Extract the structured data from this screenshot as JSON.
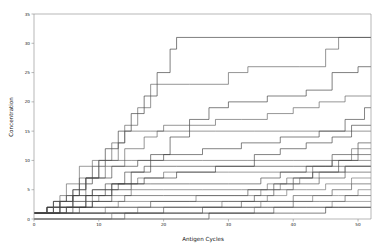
{
  "chart_data": {
    "type": "line",
    "title": "",
    "xlabel": "Antigen Cycles",
    "ylabel": "Concentration",
    "xlim": [
      0,
      52
    ],
    "ylim": [
      0,
      35
    ],
    "xticks": [
      0,
      10,
      20,
      30,
      40,
      50
    ],
    "xticklabels": [
      "0",
      "10",
      "20",
      "30",
      "40",
      "50"
    ],
    "yticks": [
      0,
      5,
      10,
      15,
      20,
      25,
      30,
      35
    ],
    "yticklabels": [
      "0",
      "5",
      "10",
      "15",
      "20",
      "25",
      "30",
      "35"
    ],
    "grid": false,
    "legend": null,
    "legend_position": "none",
    "drawstyle": "steps-post",
    "line_color": "#4d4d4d",
    "line_width": 0.6,
    "series": [
      {
        "name": "trace-1",
        "x": [
          0,
          1,
          2,
          3,
          5,
          7,
          9,
          11,
          13,
          15,
          17,
          19,
          21,
          22,
          52
        ],
        "values": [
          1,
          1,
          2,
          3,
          4,
          6,
          9,
          12,
          15,
          18,
          21,
          25,
          29,
          31,
          31
        ]
      },
      {
        "name": "trace-2",
        "x": [
          0,
          2,
          4,
          6,
          8,
          10,
          12,
          14,
          16,
          18,
          24,
          30,
          33,
          41,
          45,
          47,
          52
        ],
        "values": [
          1,
          1,
          2,
          4,
          7,
          10,
          13,
          16,
          19,
          23,
          23,
          25,
          26,
          26,
          29,
          31,
          31
        ]
      },
      {
        "name": "trace-3",
        "x": [
          0,
          3,
          6,
          9,
          12,
          15,
          18,
          21,
          24,
          27,
          30,
          36,
          42,
          46,
          50,
          52
        ],
        "values": [
          1,
          1,
          2,
          3,
          5,
          8,
          11,
          14,
          17,
          19,
          20,
          21,
          22,
          25,
          26,
          26
        ]
      },
      {
        "name": "trace-4",
        "x": [
          0,
          2,
          4,
          7,
          10,
          13,
          14,
          18,
          20,
          24,
          28,
          32,
          36,
          40,
          44,
          48,
          50,
          52
        ],
        "values": [
          1,
          2,
          4,
          7,
          10,
          13,
          15,
          15,
          16,
          16,
          17,
          17,
          18,
          19,
          20,
          21,
          21,
          21
        ]
      },
      {
        "name": "trace-5",
        "x": [
          0,
          2,
          4,
          6,
          8,
          12,
          16,
          20,
          26,
          32,
          38,
          44,
          48,
          51,
          52
        ],
        "values": [
          1,
          2,
          3,
          5,
          7,
          9,
          10,
          11,
          12,
          13,
          14,
          15,
          17,
          19,
          19
        ]
      },
      {
        "name": "trace-6",
        "x": [
          0,
          1,
          3,
          5,
          7,
          9,
          11,
          15,
          20,
          26,
          33,
          40,
          46,
          52
        ],
        "values": [
          1,
          1,
          3,
          6,
          9,
          10,
          10,
          10,
          10,
          10,
          10,
          10,
          10,
          10
        ]
      },
      {
        "name": "trace-7",
        "x": [
          0,
          2,
          5,
          8,
          11,
          14,
          17,
          22,
          28,
          34,
          40,
          45,
          49,
          52
        ],
        "values": [
          1,
          1,
          2,
          4,
          6,
          8,
          9,
          9,
          9,
          9,
          9,
          9,
          9,
          9
        ]
      },
      {
        "name": "trace-8",
        "x": [
          0,
          3,
          6,
          9,
          12,
          16,
          20,
          25,
          30,
          35,
          40,
          44,
          48,
          52
        ],
        "values": [
          1,
          2,
          3,
          5,
          6,
          7,
          8,
          8,
          8,
          8,
          8,
          8,
          9,
          9
        ]
      },
      {
        "name": "trace-9",
        "x": [
          0,
          2,
          4,
          6,
          9,
          13,
          18,
          24,
          30,
          35,
          38,
          42,
          46,
          50,
          52
        ],
        "values": [
          1,
          2,
          3,
          4,
          5,
          6,
          6,
          6,
          6,
          7,
          8,
          9,
          11,
          13,
          13
        ]
      },
      {
        "name": "trace-10",
        "x": [
          0,
          3,
          6,
          10,
          15,
          20,
          26,
          32,
          36,
          39,
          43,
          46,
          49,
          52
        ],
        "values": [
          1,
          2,
          3,
          4,
          5,
          5,
          5,
          5,
          6,
          7,
          9,
          10,
          12,
          12
        ]
      },
      {
        "name": "trace-11",
        "x": [
          0,
          2,
          5,
          9,
          14,
          20,
          27,
          33,
          37,
          40,
          43,
          47,
          50,
          52
        ],
        "values": [
          1,
          1,
          2,
          3,
          4,
          4,
          4,
          5,
          6,
          7,
          8,
          10,
          11,
          11
        ]
      },
      {
        "name": "trace-12",
        "x": [
          0,
          4,
          8,
          13,
          19,
          25,
          31,
          35,
          38,
          41,
          44,
          48,
          52
        ],
        "values": [
          1,
          2,
          2,
          3,
          3,
          4,
          4,
          5,
          6,
          7,
          8,
          9,
          9
        ]
      },
      {
        "name": "trace-13",
        "x": [
          0,
          3,
          7,
          12,
          18,
          24,
          30,
          34,
          37,
          40,
          44,
          48,
          52
        ],
        "values": [
          1,
          1,
          2,
          2,
          3,
          3,
          3,
          4,
          5,
          6,
          7,
          8,
          8
        ]
      },
      {
        "name": "trace-14",
        "x": [
          0,
          5,
          11,
          17,
          23,
          29,
          33,
          36,
          39,
          42,
          45,
          49,
          52
        ],
        "values": [
          1,
          1,
          2,
          2,
          2,
          3,
          3,
          4,
          5,
          5,
          6,
          7,
          7
        ]
      },
      {
        "name": "trace-15",
        "x": [
          0,
          6,
          13,
          20,
          27,
          32,
          36,
          40,
          43,
          46,
          49,
          52
        ],
        "values": [
          1,
          1,
          1,
          2,
          2,
          3,
          3,
          4,
          4,
          5,
          6,
          6
        ]
      },
      {
        "name": "trace-16",
        "x": [
          0,
          8,
          16,
          24,
          30,
          35,
          39,
          43,
          47,
          50,
          52
        ],
        "values": [
          1,
          1,
          2,
          2,
          2,
          3,
          3,
          4,
          4,
          5,
          5
        ]
      },
      {
        "name": "trace-17",
        "x": [
          0,
          10,
          19,
          26,
          31,
          36,
          40,
          44,
          48,
          52
        ],
        "values": [
          1,
          1,
          1,
          2,
          2,
          2,
          3,
          3,
          4,
          4
        ]
      },
      {
        "name": "trace-18",
        "x": [
          0,
          12,
          22,
          29,
          34,
          38,
          42,
          46,
          50,
          52
        ],
        "values": [
          0,
          1,
          1,
          1,
          2,
          2,
          2,
          3,
          3,
          3
        ]
      },
      {
        "name": "trace-19",
        "x": [
          0,
          14,
          24,
          31,
          37,
          42,
          47,
          52
        ],
        "values": [
          0,
          1,
          1,
          1,
          2,
          2,
          2,
          2
        ]
      },
      {
        "name": "trace-20",
        "x": [
          0,
          17,
          27,
          34,
          40,
          45,
          50,
          52
        ],
        "values": [
          0,
          0,
          1,
          1,
          1,
          2,
          2,
          2
        ]
      },
      {
        "name": "trace-21",
        "x": [
          0,
          3,
          6,
          8,
          11,
          14,
          17,
          19,
          23,
          28,
          34,
          40,
          46,
          52
        ],
        "values": [
          1,
          3,
          5,
          7,
          9,
          12,
          14,
          15,
          15,
          15,
          15,
          15,
          15,
          15
        ]
      },
      {
        "name": "trace-22",
        "x": [
          0,
          4,
          8,
          12,
          17,
          22,
          28,
          34,
          38,
          42,
          46,
          49,
          52
        ],
        "values": [
          1,
          2,
          4,
          6,
          7,
          8,
          9,
          11,
          12,
          13,
          14,
          16,
          16
        ]
      }
    ]
  },
  "axes": {
    "x_title": "Antigen Cycles",
    "y_title": "Concentration"
  }
}
